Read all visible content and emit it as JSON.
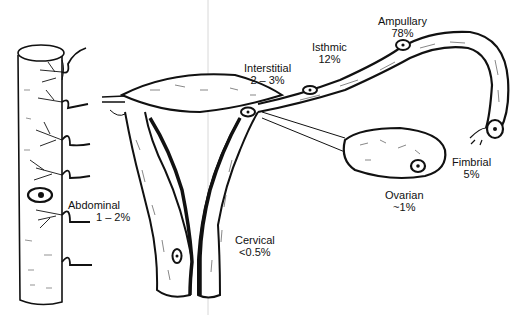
{
  "diagram": {
    "colors": {
      "ink": "#111111",
      "paper": "#ffffff",
      "hatch": "#555555",
      "guide": "#d0d0d0"
    },
    "structures": [
      {
        "id": "intestine",
        "icon": "bowel-segment"
      },
      {
        "id": "uterus",
        "icon": "uterus-coronal-section"
      },
      {
        "id": "fallopian-tube",
        "icon": "fallopian-tube"
      },
      {
        "id": "ovary",
        "icon": "ovary"
      },
      {
        "id": "cervix",
        "icon": "cervix"
      }
    ],
    "sites": [
      {
        "name": "Ampullary",
        "pct": "78%"
      },
      {
        "name": "Isthmic",
        "pct": "12%"
      },
      {
        "name": "Interstitial",
        "pct": "2 – 3%"
      },
      {
        "name": "Fimbrial",
        "pct": "5%"
      },
      {
        "name": "Ovarian",
        "pct": "~1%"
      },
      {
        "name": "Abdominal",
        "pct": "1 – 2%"
      },
      {
        "name": "Cervical",
        "pct": "<0.5%"
      }
    ]
  }
}
